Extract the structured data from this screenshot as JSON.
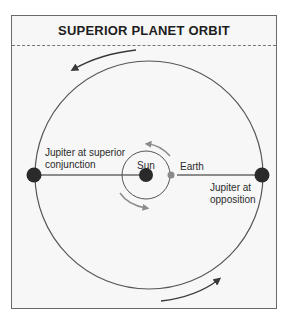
{
  "title": "SUPERIOR PLANET ORBIT",
  "labels": {
    "sun": "Sun",
    "earth": "Earth",
    "jupiter_conjunction": "Jupiter at superior conjunction",
    "jupiter_conjunction_line1": "Jupiter at superior",
    "jupiter_conjunction_line2": "conjunction",
    "jupiter_opposition_line1": "Jupiter at",
    "jupiter_opposition_line2": "opposition"
  },
  "colors": {
    "background": "#f7f7f7",
    "orbit_line": "#555555",
    "planet": "#2a2a2a",
    "earth": "#8a8a8a",
    "arrow_small": "#8c8c8c"
  }
}
